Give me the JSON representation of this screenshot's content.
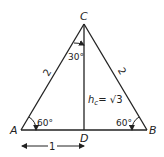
{
  "diagram": {
    "vertices": {
      "A": {
        "label": "A"
      },
      "B": {
        "label": "B"
      },
      "C": {
        "label": "C"
      },
      "D": {
        "label": "D"
      }
    },
    "sides": {
      "AC": "2",
      "BC": "2",
      "AD": "1"
    },
    "angles": {
      "A": "60°",
      "B": "60°",
      "half_C": "30°"
    },
    "height": {
      "label_h": "h",
      "label_sub": "c",
      "label_value": "= √3"
    },
    "colors": {
      "stroke": "#222222",
      "background": "#ffffff"
    }
  }
}
